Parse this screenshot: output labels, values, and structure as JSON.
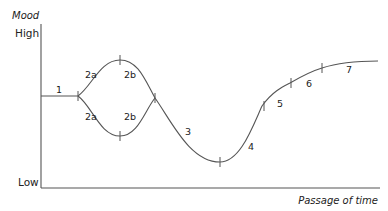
{
  "diagram": {
    "type": "line",
    "y_axis": {
      "title": "Mood",
      "high_label": "High",
      "low_label": "Low"
    },
    "x_axis": {
      "title": "Passage of time"
    },
    "stages": [
      {
        "id": "1",
        "label": "1"
      },
      {
        "id": "2a-upper",
        "label": "2a"
      },
      {
        "id": "2b-upper",
        "label": "2b"
      },
      {
        "id": "2a-lower",
        "label": "2a"
      },
      {
        "id": "2b-lower",
        "label": "2b"
      },
      {
        "id": "3",
        "label": "3"
      },
      {
        "id": "4",
        "label": "4"
      },
      {
        "id": "5",
        "label": "5"
      },
      {
        "id": "6",
        "label": "6"
      },
      {
        "id": "7",
        "label": "7"
      }
    ],
    "colors": {
      "line": "#555555",
      "text": "#222222",
      "background": "#ffffff"
    }
  }
}
